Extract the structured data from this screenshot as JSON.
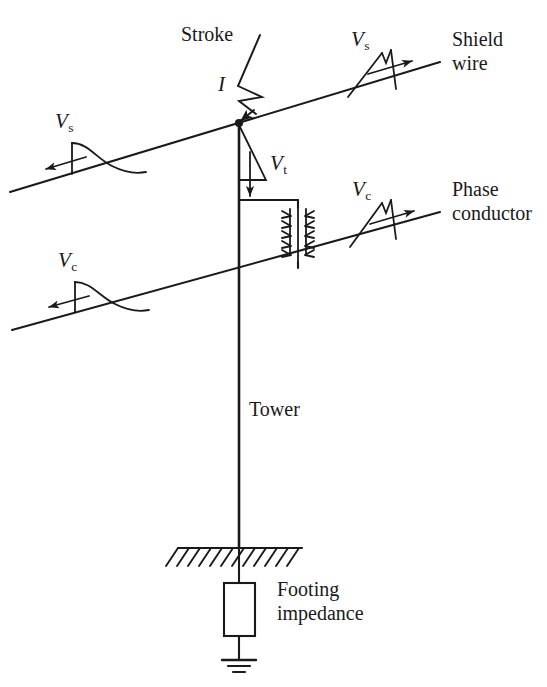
{
  "figure": {
    "type": "engineering-schematic",
    "ink_color": "#1a1a1a",
    "background_color": "#ffffff",
    "width": 547,
    "height": 687
  },
  "labels": {
    "stroke": "Stroke",
    "current_symbol": "I",
    "shield_wire": "Shield\nwire",
    "shield_wire_line1": "Shield",
    "shield_wire_line2": "wire",
    "phase_conductor_line1": "Phase",
    "phase_conductor_line2": "conductor",
    "tower": "Tower",
    "footing_line1": "Footing",
    "footing_line2": "impedance"
  },
  "voltage_labels": [
    {
      "id": "vs-left",
      "symbol": "V",
      "subscript": "s",
      "meaning": "shield-wire surge voltage travelling left",
      "direction": "left"
    },
    {
      "id": "vs-right",
      "symbol": "V",
      "subscript": "s",
      "meaning": "shield-wire surge voltage travelling right",
      "direction": "right"
    },
    {
      "id": "vt",
      "symbol": "V",
      "subscript": "t",
      "meaning": "tower-top voltage travelling down the tower",
      "direction": "down"
    },
    {
      "id": "vc-left",
      "symbol": "V",
      "subscript": "c",
      "meaning": "phase-conductor surge voltage travelling left",
      "direction": "left"
    },
    {
      "id": "vc-right",
      "symbol": "V",
      "subscript": "c",
      "meaning": "phase-conductor surge voltage travelling right",
      "direction": "right"
    }
  ],
  "components": [
    {
      "id": "shield-wire",
      "name": "shield wire",
      "kind": "conductor-line"
    },
    {
      "id": "phase-conductor",
      "name": "phase conductor",
      "kind": "conductor-line"
    },
    {
      "id": "tower",
      "name": "tower",
      "kind": "vertical-line"
    },
    {
      "id": "crossarm",
      "name": "crossarm",
      "kind": "horizontal-line"
    },
    {
      "id": "insulator-string",
      "name": "insulator string",
      "kind": "insulator",
      "disc_count": 5
    },
    {
      "id": "lightning-stroke",
      "name": "lightning stroke",
      "kind": "zigzag-arrow"
    },
    {
      "id": "ground",
      "name": "ground surface",
      "kind": "hatched-line",
      "hatch_count": 11
    },
    {
      "id": "footing-impedance",
      "name": "footing impedance",
      "kind": "resistor-box"
    },
    {
      "id": "earth-ground",
      "name": "earth ground",
      "kind": "ground-symbol",
      "bars": 3
    }
  ],
  "geometry": {
    "shield_wire": {
      "x1": 10,
      "y1": 192,
      "x2": 440,
      "y2": 62
    },
    "phase_conductor": {
      "x1": 12,
      "y1": 330,
      "x2": 440,
      "y2": 212
    },
    "tower": {
      "x": 239,
      "y_top": 123,
      "y_bottom": 548
    },
    "tower_strike_point": {
      "x": 239,
      "y": 123
    },
    "crossarm": {
      "x1": 239,
      "y1": 200,
      "x2": 297,
      "y2": 200
    },
    "insulator": {
      "x": 297,
      "y_top": 206,
      "y_bottom": 262
    },
    "ground_line": {
      "x1": 178,
      "x2": 302,
      "y": 548
    },
    "footing_box": {
      "x": 224,
      "y": 583,
      "w": 31,
      "h": 53
    },
    "earth_symbol": {
      "x": 239,
      "y": 660
    }
  }
}
